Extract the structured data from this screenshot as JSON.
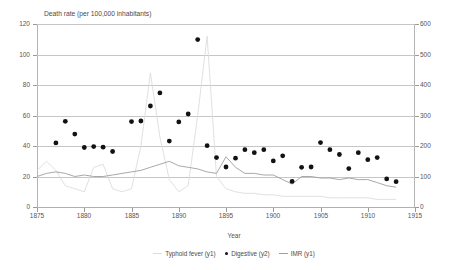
{
  "chart_data": {
    "type": "line",
    "title": "",
    "ylabel": "Death rate (per 100,000 inhabitants)",
    "xlabel": "Year",
    "xlim": [
      1875,
      1915
    ],
    "xticks": [
      1875,
      1880,
      1885,
      1890,
      1895,
      1900,
      1905,
      1910,
      1915
    ],
    "y1lim": [
      0,
      120
    ],
    "y1ticks": [
      0,
      20,
      40,
      60,
      80,
      100,
      120
    ],
    "y2lim": [
      0,
      600
    ],
    "y2ticks": [
      0,
      100,
      200,
      300,
      400,
      500,
      600
    ],
    "grid": true,
    "legend_position": "bottom",
    "series": [
      {
        "name": "Typhoid fever (y1)",
        "axis": "y1",
        "type": "line",
        "color": "#dcdcdc",
        "x": [
          1875,
          1876,
          1877,
          1878,
          1879,
          1880,
          1881,
          1882,
          1883,
          1884,
          1885,
          1886,
          1887,
          1888,
          1889,
          1890,
          1891,
          1892,
          1893,
          1894,
          1895,
          1896,
          1897,
          1898,
          1899,
          1900,
          1901,
          1902,
          1903,
          1904,
          1905,
          1906,
          1907,
          1908,
          1909,
          1910,
          1911,
          1912,
          1913
        ],
        "values": [
          24,
          30,
          24,
          14,
          12,
          10,
          26,
          28,
          12,
          10,
          12,
          40,
          88,
          46,
          18,
          10,
          14,
          60,
          112,
          20,
          12,
          10,
          9,
          9,
          8,
          8,
          7,
          7,
          7,
          7,
          7,
          6,
          6,
          6,
          6,
          6,
          5,
          5,
          5
        ]
      },
      {
        "name": "IMR (y1)",
        "axis": "y1",
        "type": "line",
        "color": "#9e9e9e",
        "x": [
          1875,
          1876,
          1877,
          1878,
          1879,
          1880,
          1881,
          1882,
          1883,
          1884,
          1885,
          1886,
          1887,
          1888,
          1889,
          1890,
          1891,
          1892,
          1893,
          1894,
          1895,
          1896,
          1897,
          1898,
          1899,
          1900,
          1901,
          1902,
          1903,
          1904,
          1905,
          1906,
          1907,
          1908,
          1909,
          1910,
          1911,
          1912,
          1913
        ],
        "values": [
          20,
          22,
          23,
          22,
          20,
          21,
          20,
          20,
          21,
          22,
          23,
          24,
          26,
          28,
          30,
          27,
          26,
          25,
          23,
          22,
          33,
          26,
          22,
          22,
          21,
          21,
          18,
          15,
          20,
          20,
          19,
          19,
          18,
          19,
          18,
          18,
          16,
          14,
          13
        ]
      },
      {
        "name": "Digestive (y2)",
        "axis": "y2",
        "type": "scatter",
        "color": "#121212",
        "x": [
          1877,
          1878,
          1879,
          1880,
          1881,
          1882,
          1883,
          1885,
          1886,
          1887,
          1888,
          1889,
          1890,
          1891,
          1892,
          1893,
          1894,
          1895,
          1896,
          1897,
          1898,
          1899,
          1900,
          1901,
          1902,
          1903,
          1904,
          1905,
          1906,
          1907,
          1908,
          1909,
          1910,
          1911,
          1912,
          1913
        ],
        "values": [
          210,
          281,
          239,
          195,
          198,
          196,
          182,
          280,
          282,
          331,
          374,
          216,
          279,
          305,
          549,
          201,
          162,
          131,
          160,
          188,
          178,
          188,
          151,
          168,
          84,
          130,
          131,
          211,
          188,
          172,
          126,
          178,
          155,
          162,
          92,
          83
        ]
      }
    ]
  },
  "legend": {
    "items": [
      {
        "label": "Typhoid fever (y1)",
        "marker": "line",
        "color": "#dcdcdc"
      },
      {
        "label": "Digestive (y2)",
        "marker": "dot",
        "color": "#121212"
      },
      {
        "label": "IMR (y1)",
        "marker": "line",
        "color": "#9e9e9e"
      }
    ]
  }
}
